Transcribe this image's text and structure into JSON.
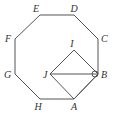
{
  "diagram": {
    "type": "geometry",
    "shape": "regular octagon ABCDEFGH with square ABIJ inside",
    "labels": {
      "A": "A",
      "B": "B",
      "C": "C",
      "D": "D",
      "E": "E",
      "F": "F",
      "G": "G",
      "H": "H",
      "I": "I",
      "J": "J"
    },
    "vertices": {
      "A": [
        74,
        99
      ],
      "B": [
        98,
        74
      ],
      "C": [
        98,
        39
      ],
      "D": [
        74,
        15
      ],
      "E": [
        40,
        15
      ],
      "F": [
        15,
        39
      ],
      "G": [
        15,
        74
      ],
      "H": [
        40,
        99
      ],
      "I": [
        74,
        50
      ],
      "J": [
        50,
        74
      ]
    },
    "segments": [
      "AB",
      "BC",
      "CD",
      "DE",
      "EF",
      "FG",
      "GH",
      "HA",
      "AJ",
      "JI",
      "IB",
      "JB"
    ],
    "annotations": [
      "small arc marking angle at B between BJ and BI/BA"
    ],
    "colors": {
      "stroke": "#555555",
      "text": "#333333",
      "background": "#ffffff"
    }
  }
}
